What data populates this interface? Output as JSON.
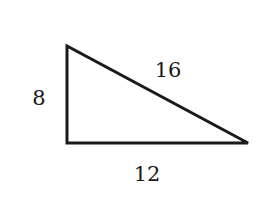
{
  "diagram": {
    "type": "right-triangle",
    "vertices": {
      "top": [
        67,
        46
      ],
      "bottom_left": [
        67,
        143
      ],
      "bottom_right": [
        248,
        143
      ]
    },
    "sides": [
      {
        "name": "left",
        "label": "8"
      },
      {
        "name": "hypotenuse",
        "label": "16"
      },
      {
        "name": "bottom",
        "label": "12"
      }
    ],
    "stroke_color": "#1a1a1a"
  }
}
